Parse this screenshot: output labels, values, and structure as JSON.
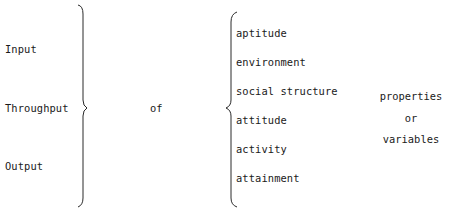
{
  "diagram": {
    "left_terms": [
      "Input",
      "Throughput",
      "Output"
    ],
    "connector": "of",
    "middle_terms": [
      "aptitude",
      "environment",
      "social structure",
      "attitude",
      "activity",
      "attainment"
    ],
    "right_terms": [
      "properties",
      "or",
      "variables"
    ]
  }
}
